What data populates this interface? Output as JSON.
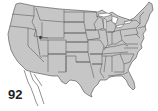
{
  "map": {
    "subject": "Contiguous United States with state borders",
    "fill_color": "#c6c6c6",
    "border_color": "#4a4a4a",
    "background": "#ffffff",
    "features": [
      "state-boundaries",
      "great-lakes",
      "great-salt-lake",
      "baja-california-outline"
    ]
  },
  "label": {
    "number": "92"
  }
}
